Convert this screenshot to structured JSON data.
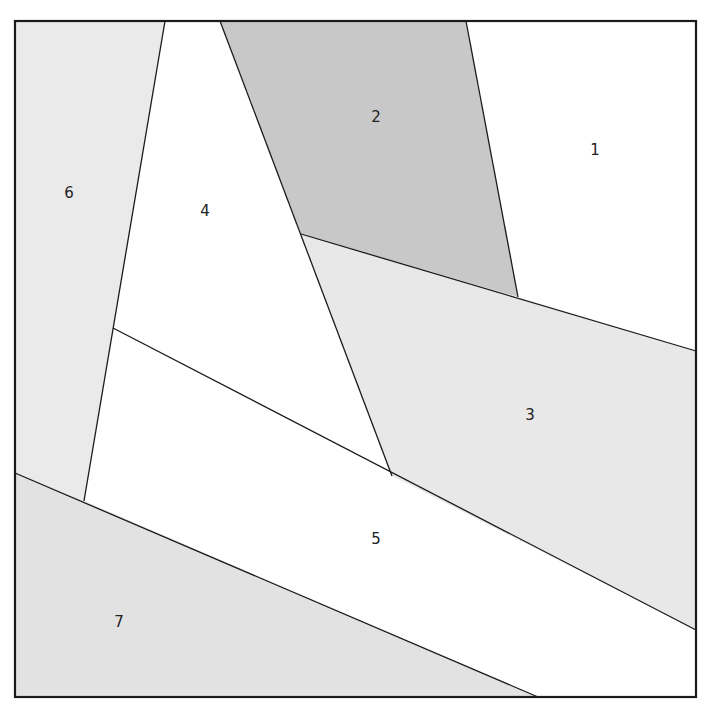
{
  "diagram": {
    "type": "region-partition",
    "frame": {
      "x": 15,
      "y": 21,
      "width": 681,
      "height": 676
    },
    "regions": [
      {
        "id": "1",
        "label": "1",
        "fill": "#ffffff",
        "points": "466,21 696,21 696,351 518,297",
        "label_pos": [
          595,
          155
        ]
      },
      {
        "id": "2",
        "label": "2",
        "fill": "#c8c8c8",
        "points": "220,21 466,21 518,297 301,234",
        "label_pos": [
          376,
          122
        ]
      },
      {
        "id": "3",
        "label": "3",
        "fill": "#e8e8e8",
        "points": "301,234 518,297 696,351 696,630 392,476",
        "label_pos": [
          530,
          420
        ]
      },
      {
        "id": "4",
        "label": "4",
        "fill": "#ffffff",
        "points": "165,21 220,21 301,234 392,476 113,328",
        "label_pos": [
          205,
          216
        ]
      },
      {
        "id": "5",
        "label": "5",
        "fill": "#ffffff",
        "points": "113,328 392,476 696,630 696,697 538,697 84,501",
        "label_pos": [
          376,
          544
        ]
      },
      {
        "id": "6",
        "label": "6",
        "fill": "#eaeaea",
        "points": "15,21 165,21 84,501 15,473",
        "label_pos": [
          69,
          198
        ]
      },
      {
        "id": "7",
        "label": "7",
        "fill": "#e2e2e2",
        "points": "15,473 84,501 538,697 15,697",
        "label_pos": [
          119,
          627
        ]
      }
    ],
    "edges": [
      {
        "name": "edge-6-4",
        "x1": 165,
        "y1": 21,
        "x2": 84,
        "y2": 501
      },
      {
        "name": "edge-4-2",
        "x1": 220,
        "y1": 21,
        "x2": 392,
        "y2": 476
      },
      {
        "name": "edge-2-1",
        "x1": 466,
        "y1": 21,
        "x2": 518,
        "y2": 297
      },
      {
        "name": "edge-2-1-3",
        "x1": 301,
        "y1": 234,
        "x2": 696,
        "y2": 351
      },
      {
        "name": "edge-4-3-5",
        "x1": 113,
        "y1": 328,
        "x2": 696,
        "y2": 630
      },
      {
        "name": "edge-7",
        "x1": 15,
        "y1": 473,
        "x2": 538,
        "y2": 697
      }
    ],
    "colors": {
      "stroke": "#1a1a1a",
      "dark_gray": "#c8c8c8",
      "light_gray": "#e8e8e8",
      "white": "#ffffff"
    }
  }
}
